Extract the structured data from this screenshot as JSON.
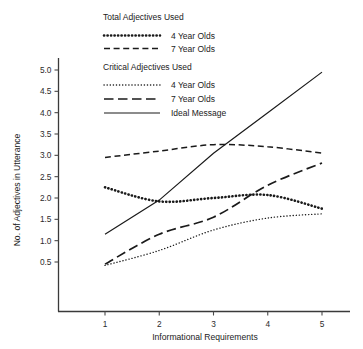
{
  "chart_data": {
    "type": "line",
    "title": "",
    "xlabel": "Informational Requirements",
    "ylabel": "No. of Adjectives in Utterance",
    "x": [
      1,
      2,
      3,
      4,
      5
    ],
    "xlim": [
      0.55,
      5.5
    ],
    "ylim": [
      0.0,
      5.35
    ],
    "xticks": [
      "1",
      "2",
      "3",
      "4",
      "5"
    ],
    "yticks": [
      "0.5",
      "1.0",
      "1.5",
      "2.0",
      "2.5",
      "3.0",
      "3.5",
      "4.0",
      "4.5",
      "5.0"
    ],
    "ytick_values": [
      0.5,
      1.0,
      1.5,
      2.0,
      2.5,
      3.0,
      3.5,
      4.0,
      4.5,
      5.0
    ],
    "grid": false,
    "legend_position": "upper-center",
    "series": [
      {
        "name": "Total Adjectives Used — 4 Year Olds",
        "group": "Total Adjectives Used",
        "label": "4 Year Olds",
        "style": "thick-dotted",
        "values": [
          2.25,
          1.92,
          2.0,
          2.07,
          1.75
        ]
      },
      {
        "name": "Total Adjectives Used — 7 Year Olds",
        "group": "Total Adjectives Used",
        "label": "7 Year Olds",
        "style": "dashed",
        "values": [
          2.95,
          3.1,
          3.25,
          3.2,
          3.05
        ]
      },
      {
        "name": "Critical Adjectives Used — 4 Year Olds",
        "group": "Critical Adjectives Used",
        "label": "4 Year Olds",
        "style": "fine-dotted",
        "values": [
          0.42,
          0.77,
          1.25,
          1.53,
          1.63
        ]
      },
      {
        "name": "Critical Adjectives Used — 7 Year Olds",
        "group": "Critical Adjectives Used",
        "label": "7 Year Olds",
        "style": "long-dashed",
        "values": [
          0.45,
          1.15,
          1.55,
          2.3,
          2.82
        ]
      },
      {
        "name": "Ideal Message",
        "group": "",
        "label": "Ideal Message",
        "style": "solid",
        "values": [
          1.15,
          1.95,
          3.05,
          4.0,
          4.95
        ]
      }
    ]
  },
  "legend": {
    "heading_total": "Total Adjectives Used",
    "heading_critical": "Critical Adjectives Used",
    "entries": [
      {
        "label": "4 Year Olds"
      },
      {
        "label": "7 Year Olds"
      },
      {
        "label": "4 Year Olds"
      },
      {
        "label": "7 Year Olds"
      },
      {
        "label": "Ideal Message"
      }
    ]
  },
  "axes": {
    "x_title": "Informational Requirements",
    "y_title": "No. of Adjectives in Utterance"
  },
  "colors": {
    "ink": "#1a1a1a",
    "axis": "#3a3a3a",
    "background": "#ffffff"
  }
}
